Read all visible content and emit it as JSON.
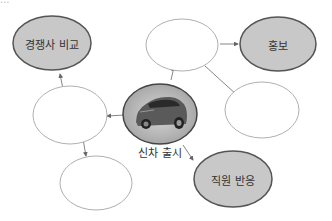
{
  "header_fragment": "...",
  "center": {
    "label": "신차 출시",
    "icon": "car-icon"
  },
  "nodes": [
    {
      "id": "competitor",
      "label": "경쟁사 비교",
      "filled": true
    },
    {
      "id": "promotion",
      "label": "홍보",
      "filled": true
    },
    {
      "id": "employee",
      "label": "직원 반응",
      "filled": true
    },
    {
      "id": "top-blank",
      "label": "",
      "filled": false
    },
    {
      "id": "left-blank",
      "label": "",
      "filled": false
    },
    {
      "id": "right-blank",
      "label": "",
      "filled": false
    },
    {
      "id": "bottom-blank",
      "label": "",
      "filled": false
    }
  ],
  "colors": {
    "filled": "#c8c8c8",
    "stroke": "#555555",
    "blank_stroke": "#b0b0b0",
    "arrow": "#666666"
  }
}
